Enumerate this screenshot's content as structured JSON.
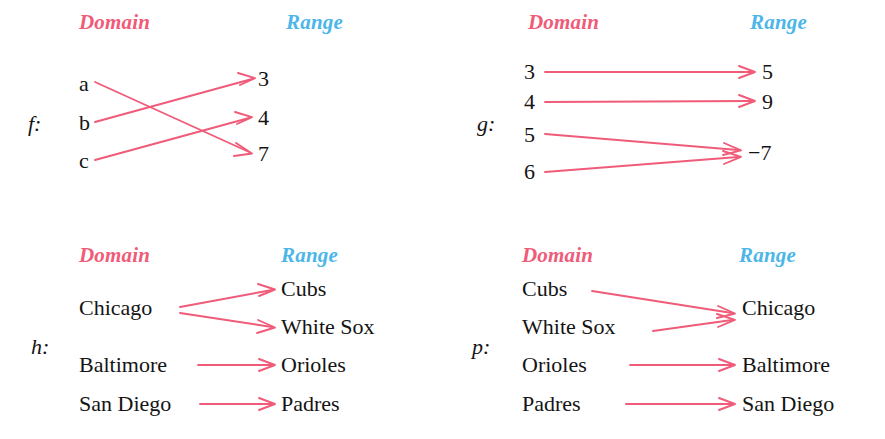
{
  "figure": {
    "header_domain": "Domain",
    "header_range": "Range",
    "arrow_color": "#ef5b78",
    "domain_label_color": "#ef5b78",
    "range_label_color": "#4cb6e8",
    "text_color": "#141414",
    "background": "#ffffff"
  },
  "panels": [
    {
      "name": "f",
      "label": "f:",
      "header_domain": "Domain",
      "header_range": "Range",
      "domain": [
        "a",
        "b",
        "c"
      ],
      "range": [
        "3",
        "4",
        "7"
      ],
      "mappings": [
        {
          "from": "a",
          "to": "7"
        },
        {
          "from": "b",
          "to": "3"
        },
        {
          "from": "c",
          "to": "4"
        }
      ]
    },
    {
      "name": "g",
      "label": "g:",
      "header_domain": "Domain",
      "header_range": "Range",
      "domain": [
        "3",
        "4",
        "5",
        "6"
      ],
      "range": [
        "5",
        "9",
        "−7"
      ],
      "mappings": [
        {
          "from": "3",
          "to": "5"
        },
        {
          "from": "4",
          "to": "9"
        },
        {
          "from": "5",
          "to": "−7"
        },
        {
          "from": "6",
          "to": "−7"
        }
      ]
    },
    {
      "name": "h",
      "label": "h:",
      "header_domain": "Domain",
      "header_range": "Range",
      "domain": [
        "Chicago",
        "Baltimore",
        "San Diego"
      ],
      "range": [
        "Cubs",
        "White Sox",
        "Orioles",
        "Padres"
      ],
      "mappings": [
        {
          "from": "Chicago",
          "to": "Cubs"
        },
        {
          "from": "Chicago",
          "to": "White Sox"
        },
        {
          "from": "Baltimore",
          "to": "Orioles"
        },
        {
          "from": "San Diego",
          "to": "Padres"
        }
      ]
    },
    {
      "name": "p",
      "label": "p:",
      "header_domain": "Domain",
      "header_range": "Range",
      "domain": [
        "Cubs",
        "White Sox",
        "Orioles",
        "Padres"
      ],
      "range": [
        "Chicago",
        "Baltimore",
        "San Diego"
      ],
      "mappings": [
        {
          "from": "Cubs",
          "to": "Chicago"
        },
        {
          "from": "White Sox",
          "to": "Chicago"
        },
        {
          "from": "Orioles",
          "to": "Baltimore"
        },
        {
          "from": "Padres",
          "to": "San Diego"
        }
      ]
    }
  ]
}
